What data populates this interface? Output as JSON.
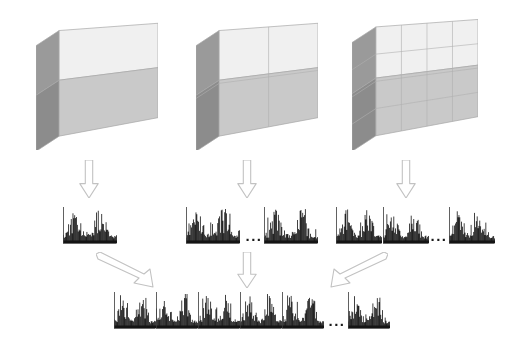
{
  "figure": {
    "background_color": "#ffffff",
    "width": 509,
    "height": 343
  },
  "palette": {
    "face_top_front": "#f0f0f0",
    "face_bottom_front": "#c9c9c9",
    "face_side_dark": "#9a9a9a",
    "face_side_darker": "#8c8c8c",
    "grid_line": "#b0b0b0",
    "outline": "#a8a8a8",
    "arrow_stroke": "#c2c2c2",
    "histogram_bar": "#141414",
    "histogram_frame": "#3a3a3a",
    "ellipsis_color": "#1a1a1a"
  },
  "volumes": [
    {
      "name": "volume-level-0",
      "label": "1 x 1 subdivision",
      "divisions_x": 1,
      "divisions_y": 1,
      "cells": 1,
      "x": 36,
      "y": 18,
      "w": 122,
      "h": 132
    },
    {
      "name": "volume-level-1",
      "label": "2 x 2 subdivision",
      "divisions_x": 2,
      "divisions_y": 2,
      "cells": 4,
      "x": 196,
      "y": 18,
      "w": 122,
      "h": 132
    },
    {
      "name": "volume-level-2",
      "label": "4 x 4 subdivision",
      "divisions_x": 4,
      "divisions_y": 4,
      "cells": 16,
      "x": 352,
      "y": 14,
      "w": 126,
      "h": 136
    }
  ],
  "arrows_row1": [
    {
      "name": "arrow-down-level-0",
      "direction": "down",
      "x": 78,
      "y": 160,
      "w": 22,
      "h": 38
    },
    {
      "name": "arrow-down-level-1",
      "direction": "down",
      "x": 236,
      "y": 160,
      "w": 22,
      "h": 38
    },
    {
      "name": "arrow-down-level-2",
      "direction": "down",
      "x": 395,
      "y": 160,
      "w": 22,
      "h": 38
    }
  ],
  "arrows_row2": [
    {
      "name": "arrow-diagonal-down-right",
      "direction": "down-right",
      "x": 96,
      "y": 252,
      "w": 58,
      "h": 36
    },
    {
      "name": "arrow-down-center",
      "direction": "down",
      "x": 236,
      "y": 252,
      "w": 22,
      "h": 36
    },
    {
      "name": "arrow-diagonal-down-left",
      "direction": "down-left",
      "x": 330,
      "y": 252,
      "w": 58,
      "h": 36
    }
  ],
  "histogram_rows": [
    {
      "name": "histogram-row-level-0",
      "level": 0,
      "y": 206,
      "height": 40,
      "items": [
        {
          "type": "histogram",
          "name": "histogram-l0-1",
          "x": 63,
          "w": 54,
          "seed": 11
        }
      ]
    },
    {
      "name": "histogram-row-level-1",
      "level": 1,
      "y": 206,
      "height": 40,
      "items": [
        {
          "type": "histogram",
          "name": "histogram-l1-1",
          "x": 186,
          "w": 54,
          "seed": 21
        },
        {
          "type": "ellipsis",
          "name": "ellipsis-level-1",
          "text": "...",
          "x": 243,
          "w": 22,
          "font_size": 15
        },
        {
          "type": "histogram",
          "name": "histogram-l1-n",
          "x": 264,
          "w": 54,
          "seed": 22
        }
      ]
    },
    {
      "name": "histogram-row-level-2",
      "level": 2,
      "y": 206,
      "height": 40,
      "items": [
        {
          "type": "histogram",
          "name": "histogram-l2-1",
          "x": 336,
          "w": 46,
          "seed": 31
        },
        {
          "type": "histogram",
          "name": "histogram-l2-2",
          "x": 383,
          "w": 46,
          "seed": 32
        },
        {
          "type": "ellipsis",
          "name": "ellipsis-level-2",
          "text": "...",
          "x": 428,
          "w": 22,
          "font_size": 15
        },
        {
          "type": "histogram",
          "name": "histogram-l2-n",
          "x": 449,
          "w": 46,
          "seed": 33
        }
      ]
    },
    {
      "name": "histogram-row-concatenated",
      "level": 3,
      "y": 291,
      "height": 40,
      "items": [
        {
          "type": "histogram",
          "name": "histogram-final-1",
          "x": 114,
          "w": 42,
          "seed": 41
        },
        {
          "type": "histogram",
          "name": "histogram-final-2",
          "x": 156,
          "w": 42,
          "seed": 42
        },
        {
          "type": "histogram",
          "name": "histogram-final-3",
          "x": 198,
          "w": 42,
          "seed": 43
        },
        {
          "type": "histogram",
          "name": "histogram-final-4",
          "x": 240,
          "w": 42,
          "seed": 44
        },
        {
          "type": "histogram",
          "name": "histogram-final-5",
          "x": 282,
          "w": 42,
          "seed": 45
        },
        {
          "type": "ellipsis",
          "name": "ellipsis-final",
          "text": "...",
          "x": 326,
          "w": 22,
          "font_size": 15
        },
        {
          "type": "histogram",
          "name": "histogram-final-n",
          "x": 348,
          "w": 42,
          "seed": 46
        }
      ]
    }
  ]
}
